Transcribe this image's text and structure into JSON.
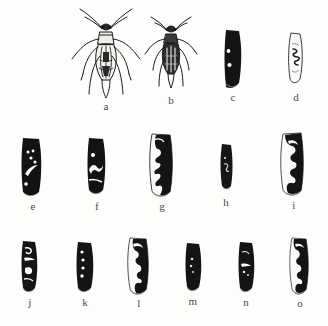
{
  "figure": {
    "kind": "scientific-illustration-plate",
    "background_color": "#fdfdfc",
    "ink_color": "#111111",
    "caption_color": "#4a4a48",
    "panel_count": 15,
    "rows": 3
  },
  "panels": [
    {
      "label": "a",
      "subject": "whole insect, dorsal view",
      "description": "elongate bug with long antennae, slender legs, pale pronotum and dark mottled abdomen",
      "style": "line drawing",
      "row": 1,
      "column": 1
    },
    {
      "label": "b",
      "subject": "whole insect, dorsal view",
      "description": "smaller stockier bug with curved antennae and dark speckled hemelytra",
      "style": "line drawing",
      "row": 1,
      "column": 2
    },
    {
      "label": "c",
      "subject": "hemelytron",
      "description": "solid black wing with two small white spots on the inner margin",
      "style": "filled silhouette",
      "row": 1,
      "column": 3
    },
    {
      "label": "d",
      "subject": "hemelytron",
      "description": "pale outlined wing with a small dark sinuous marking near the centre",
      "style": "outline",
      "row": 1,
      "column": 4
    },
    {
      "label": "e",
      "subject": "hemelytron",
      "description": "black wing with three small white dots above a long curved white streak",
      "style": "filled silhouette",
      "row": 2,
      "column": 1
    },
    {
      "label": "f",
      "subject": "hemelytron",
      "description": "black wing with one white dot and a narrow white zigzag band across the middle",
      "style": "filled silhouette",
      "row": 2,
      "column": 2
    },
    {
      "label": "g",
      "subject": "hemelytron",
      "description": "black wing with broad branching white zigzag markings and pale outer border",
      "style": "filled silhouette",
      "row": 2,
      "column": 3
    },
    {
      "label": "h",
      "subject": "hemelytron",
      "description": "narrow black wing with a faint thin white hook near the centre",
      "style": "filled silhouette",
      "row": 2,
      "column": 4
    },
    {
      "label": "i",
      "subject": "hemelytron",
      "description": "black wing with bold white hook at top and a large white angular blotch below",
      "style": "filled silhouette",
      "row": 2,
      "column": 5
    },
    {
      "label": "j",
      "subject": "hemelytron",
      "description": "narrow black wing with small white hook and white angular mark at the base",
      "style": "filled silhouette",
      "row": 3,
      "column": 1
    },
    {
      "label": "k",
      "subject": "hemelytron",
      "description": "black wing with a vertical row of four small white dots on the inner margin",
      "style": "filled silhouette",
      "row": 3,
      "column": 2
    },
    {
      "label": "l",
      "subject": "hemelytron",
      "description": "black wing with white hook above and a large white stepped blotch, pale outer border",
      "style": "filled silhouette",
      "row": 3,
      "column": 3
    },
    {
      "label": "m",
      "subject": "hemelytron",
      "description": "black wing with two faint small white dots near the inner margin",
      "style": "filled silhouette",
      "row": 3,
      "column": 4
    },
    {
      "label": "n",
      "subject": "hemelytron",
      "description": "black wing with a short white bar and small white dots in the middle",
      "style": "filled silhouette",
      "row": 3,
      "column": 5
    },
    {
      "label": "o",
      "subject": "hemelytron",
      "description": "black wing with white hook at top and irregular white streaks below",
      "style": "filled silhouette",
      "row": 3,
      "column": 6
    }
  ]
}
